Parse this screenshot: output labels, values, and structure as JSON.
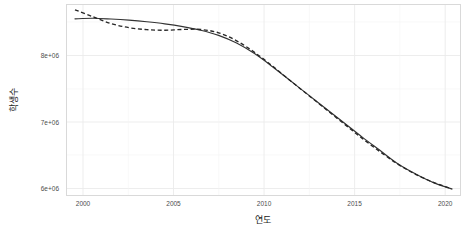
{
  "chart_data": {
    "type": "line",
    "title": "",
    "xlabel": "연도",
    "ylabel": "학생수",
    "xlim": [
      1998.5,
      2020.5
    ],
    "ylim": [
      5850000,
      8850000
    ],
    "grid": true,
    "legend": "none",
    "x_tick_labels": [
      "2000",
      "2005",
      "2010",
      "2015",
      "2020"
    ],
    "x_ticks": [
      2000,
      2005,
      2010,
      2015,
      2020
    ],
    "y_tick_labels": [
      "8e+06",
      "7e+06",
      "6e+06"
    ],
    "y_ticks": [
      8000000,
      7000000,
      6000000
    ],
    "y_minor_ticks": [
      8500000,
      7500000,
      6500000
    ],
    "x": [
      1999,
      2000,
      2001,
      2002,
      2003,
      2004,
      2005,
      2006,
      2007,
      2008,
      2009,
      2010,
      2011,
      2012,
      2013,
      2014,
      2015,
      2016,
      2017,
      2018,
      2019,
      2020
    ],
    "series": [
      {
        "name": "solid-line",
        "style": "solid",
        "color": "#333333",
        "values": [
          8618000,
          8627000,
          8615000,
          8597000,
          8572000,
          8540000,
          8497000,
          8440000,
          8360000,
          8240000,
          8075000,
          7870000,
          7650000,
          7430000,
          7210000,
          6990000,
          6770000,
          6560000,
          6350000,
          6190000,
          6055000,
          5960000
        ]
      },
      {
        "name": "dashed-line",
        "style": "dashed",
        "color": "#262626",
        "values": [
          8760000,
          8650000,
          8545000,
          8480000,
          8450000,
          8440000,
          8452000,
          8452000,
          8400000,
          8275000,
          8095000,
          7880000,
          7650000,
          7425000,
          7200000,
          6975000,
          6750000,
          6540000,
          6345000,
          6185000,
          6060000,
          5960000
        ]
      }
    ]
  },
  "axis": {
    "y_title": "학생수",
    "x_title": "연도"
  }
}
